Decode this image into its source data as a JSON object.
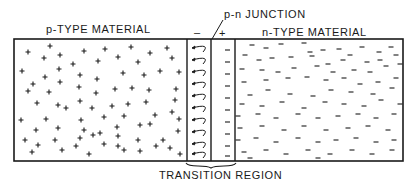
{
  "labels": {
    "p_type": "p-TYPE MATERIAL",
    "n_type": "n-TYPE MATERIAL",
    "junction": "p-n JUNCTION",
    "transition": "TRANSITION REGION",
    "minus_sign": "–",
    "plus_sign": "+"
  },
  "colors": {
    "ink": "#1a1a1a",
    "background": "#ffffff"
  },
  "geometry": {
    "box": {
      "left": 14,
      "top": 39,
      "right": 403,
      "bottom": 161
    },
    "transition_left": 187,
    "junction_x": 211,
    "transition_right": 235,
    "arc_rows_y": [
      48,
      60,
      72,
      84,
      96,
      108,
      120,
      132,
      144,
      154
    ]
  },
  "p_charges": [
    [
      28,
      52
    ],
    [
      50,
      46
    ],
    [
      44,
      58
    ],
    [
      60,
      55
    ],
    [
      84,
      51
    ],
    [
      105,
      49
    ],
    [
      131,
      47
    ],
    [
      150,
      53
    ],
    [
      167,
      48
    ],
    [
      22,
      71
    ],
    [
      45,
      77
    ],
    [
      59,
      69
    ],
    [
      73,
      64
    ],
    [
      98,
      61
    ],
    [
      118,
      57
    ],
    [
      138,
      62
    ],
    [
      172,
      58
    ],
    [
      33,
      84
    ],
    [
      60,
      82
    ],
    [
      80,
      75
    ],
    [
      97,
      79
    ],
    [
      123,
      73
    ],
    [
      144,
      75
    ],
    [
      160,
      71
    ],
    [
      179,
      72
    ],
    [
      28,
      91
    ],
    [
      49,
      92
    ],
    [
      79,
      87
    ],
    [
      96,
      93
    ],
    [
      115,
      89
    ],
    [
      132,
      88
    ],
    [
      149,
      90
    ],
    [
      176,
      89
    ],
    [
      37,
      103
    ],
    [
      58,
      105
    ],
    [
      80,
      101
    ],
    [
      92,
      108
    ],
    [
      112,
      106
    ],
    [
      128,
      104
    ],
    [
      146,
      102
    ],
    [
      175,
      100
    ],
    [
      21,
      120
    ],
    [
      46,
      119
    ],
    [
      66,
      108
    ],
    [
      81,
      120
    ],
    [
      104,
      117
    ],
    [
      124,
      116
    ],
    [
      155,
      115
    ],
    [
      172,
      112
    ],
    [
      36,
      130
    ],
    [
      58,
      128
    ],
    [
      84,
      130
    ],
    [
      93,
      135
    ],
    [
      117,
      127
    ],
    [
      140,
      125
    ],
    [
      150,
      124
    ],
    [
      179,
      119
    ],
    [
      25,
      140
    ],
    [
      38,
      145
    ],
    [
      55,
      140
    ],
    [
      80,
      138
    ],
    [
      100,
      133
    ],
    [
      118,
      136
    ],
    [
      138,
      140
    ],
    [
      163,
      140
    ],
    [
      178,
      131
    ],
    [
      32,
      152
    ],
    [
      62,
      150
    ],
    [
      76,
      146
    ],
    [
      89,
      154
    ],
    [
      104,
      144
    ],
    [
      118,
      146
    ],
    [
      124,
      150
    ],
    [
      140,
      151
    ],
    [
      156,
      146
    ],
    [
      170,
      148
    ],
    [
      180,
      154
    ]
  ],
  "n_charges": [
    [
      252,
      45
    ],
    [
      266,
      48
    ],
    [
      281,
      44
    ],
    [
      304,
      43
    ],
    [
      310,
      52
    ],
    [
      323,
      50
    ],
    [
      339,
      49
    ],
    [
      350,
      55
    ],
    [
      362,
      47
    ],
    [
      379,
      52
    ],
    [
      391,
      47
    ],
    [
      245,
      55
    ],
    [
      259,
      60
    ],
    [
      272,
      58
    ],
    [
      291,
      57
    ],
    [
      312,
      56
    ],
    [
      328,
      64
    ],
    [
      343,
      60
    ],
    [
      367,
      62
    ],
    [
      380,
      60
    ],
    [
      396,
      55
    ],
    [
      242,
      69
    ],
    [
      262,
      70
    ],
    [
      278,
      72
    ],
    [
      294,
      68
    ],
    [
      317,
      66
    ],
    [
      333,
      72
    ],
    [
      354,
      70
    ],
    [
      370,
      72
    ],
    [
      386,
      66
    ],
    [
      400,
      64
    ],
    [
      244,
      82
    ],
    [
      266,
      80
    ],
    [
      288,
      78
    ],
    [
      307,
      77
    ],
    [
      326,
      80
    ],
    [
      344,
      78
    ],
    [
      360,
      84
    ],
    [
      378,
      82
    ],
    [
      396,
      78
    ],
    [
      250,
      95
    ],
    [
      268,
      90
    ],
    [
      290,
      94
    ],
    [
      313,
      96
    ],
    [
      331,
      90
    ],
    [
      351,
      92
    ],
    [
      373,
      94
    ],
    [
      392,
      88
    ],
    [
      242,
      104
    ],
    [
      262,
      106
    ],
    [
      282,
      102
    ],
    [
      304,
      108
    ],
    [
      325,
      102
    ],
    [
      344,
      104
    ],
    [
      364,
      106
    ],
    [
      381,
      100
    ],
    [
      400,
      104
    ],
    [
      238,
      116
    ],
    [
      258,
      114
    ],
    [
      276,
      118
    ],
    [
      298,
      114
    ],
    [
      318,
      118
    ],
    [
      338,
      116
    ],
    [
      358,
      114
    ],
    [
      376,
      118
    ],
    [
      394,
      114
    ],
    [
      240,
      128
    ],
    [
      262,
      126
    ],
    [
      284,
      130
    ],
    [
      304,
      126
    ],
    [
      326,
      130
    ],
    [
      348,
      128
    ],
    [
      368,
      126
    ],
    [
      388,
      130
    ],
    [
      238,
      140
    ],
    [
      256,
      138
    ],
    [
      276,
      142
    ],
    [
      298,
      138
    ],
    [
      318,
      142
    ],
    [
      336,
      140
    ],
    [
      356,
      138
    ],
    [
      376,
      142
    ],
    [
      394,
      140
    ],
    [
      244,
      152
    ],
    [
      266,
      150
    ],
    [
      286,
      154
    ],
    [
      308,
      150
    ],
    [
      330,
      154
    ],
    [
      352,
      150
    ],
    [
      372,
      154
    ],
    [
      392,
      150
    ],
    [
      250,
      158
    ],
    [
      318,
      158
    ]
  ]
}
